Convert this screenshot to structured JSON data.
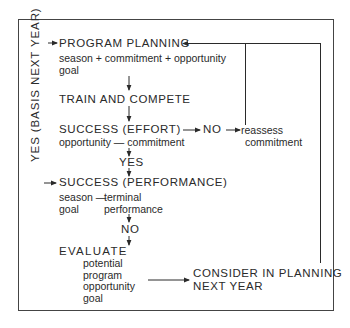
{
  "diagram": {
    "side_label": "YES (BASIS NEXT YEAR)",
    "nodes": {
      "program_planning": {
        "title": "PROGRAM PLANNING",
        "line1": "season + commitment + opportunity",
        "line2": "goal"
      },
      "train_compete": {
        "title": "TRAIN AND COMPETE"
      },
      "success_effort": {
        "title": "SUCCESS (EFFORT)",
        "line1": "opportunity — commitment"
      },
      "no_effort": {
        "label": "NO"
      },
      "reassess": {
        "line1": "reassess",
        "line2": "commitment"
      },
      "yes_effort": {
        "label": "YES"
      },
      "success_performance": {
        "title": "SUCCESS (PERFORMANCE)",
        "col1_line1": "season —",
        "col1_line2": "goal",
        "col2_line1": "terminal",
        "col2_line2": "performance"
      },
      "no_performance": {
        "label": "NO"
      },
      "evaluate": {
        "title": "EVALUATE",
        "items": [
          "potential",
          "program",
          "opportunity",
          "goal"
        ]
      },
      "consider": {
        "line1": "CONSIDER IN PLANNING",
        "line2": "NEXT YEAR"
      }
    },
    "colors": {
      "line": "#2a2a2a",
      "background": "#ffffff"
    }
  }
}
